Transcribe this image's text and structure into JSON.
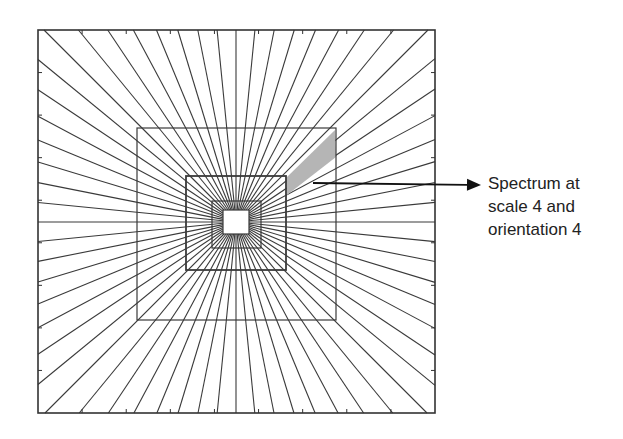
{
  "figure": {
    "annotation": {
      "lines": [
        "Spectrum at",
        "scale 4 and",
        "orientation 4"
      ]
    },
    "colors": {
      "line": "#3a3a3a",
      "frame": "#333333",
      "shade": "#b5b5b5",
      "background": "#ffffff",
      "arrow": "#111111"
    },
    "geometry": {
      "center": [
        236,
        222
      ],
      "outer_frame": [
        38,
        30,
        435,
        413
      ],
      "squares": [
        [
          137,
          128,
          336,
          320
        ],
        [
          186,
          176,
          286,
          270
        ],
        [
          212,
          201,
          261,
          248
        ],
        [
          223,
          210,
          249,
          234
        ]
      ],
      "ray_count": 64,
      "shaded_wedge": [
        [
          335,
          130
        ],
        [
          336,
          157
        ],
        [
          287,
          195
        ],
        [
          286,
          178
        ]
      ],
      "arrow": {
        "from": [
          313,
          183
        ],
        "to": [
          481,
          185
        ]
      }
    },
    "scales": 4,
    "orientations_per_half": 32
  }
}
